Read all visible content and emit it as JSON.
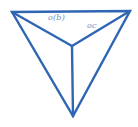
{
  "diagram": {
    "type": "triangle-subdivision",
    "stroke_color": "#2f66b3",
    "label_color": "#6f8fc2",
    "vertices": {
      "top_left": [
        12,
        12
      ],
      "top_right": [
        130,
        11
      ],
      "bottom": [
        73,
        116
      ],
      "center": [
        72,
        46
      ]
    },
    "labels": {
      "b": "o(b)",
      "c": "oc"
    }
  }
}
